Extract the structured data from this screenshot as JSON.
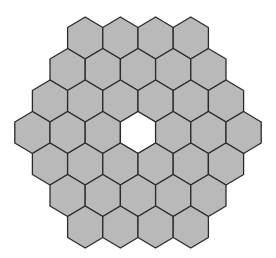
{
  "diagram": {
    "shape": "pointy-top hexagon grid arranged as a larger hexagon",
    "rows": [
      4,
      5,
      6,
      7,
      6,
      5,
      4
    ],
    "total_cells": 37,
    "filled_cells": 36,
    "empty_cells": [
      {
        "row": 3,
        "col": 3,
        "label": "center"
      }
    ],
    "geometry": {
      "center_x": 138,
      "center_y": 132.5,
      "cell_width": 35.2,
      "cell_half_height": 21,
      "row_spacing": 31.5
    },
    "colors": {
      "fill": "#b9b9b9",
      "empty_fill": "#ffffff",
      "stroke": "#2b2b2b",
      "background": "#ffffff"
    },
    "stroke_width": 1.3
  }
}
